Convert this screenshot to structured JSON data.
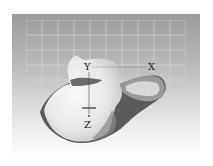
{
  "figure": {
    "background": "grid",
    "axes": {
      "x_label": "X",
      "y_label": "Y",
      "z_label": "Z"
    }
  },
  "colors": {
    "bone_light": "#f2f2f2",
    "bone_shadow": "#6e6e6e",
    "bone_dark": "#4a4a4a",
    "grid_line": "#d8d8d8",
    "panel_top": "#9c9c9c",
    "panel_bottom": "#ffffff"
  }
}
